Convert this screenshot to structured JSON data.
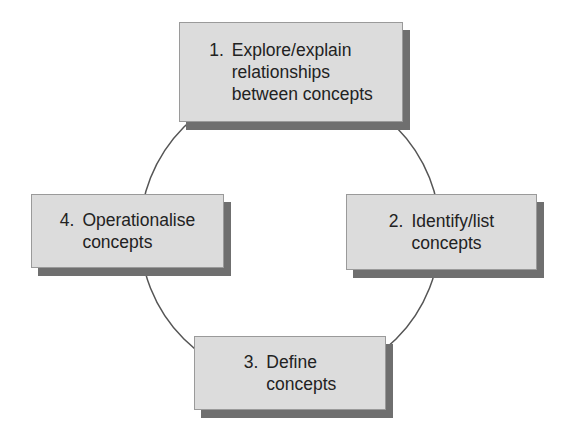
{
  "diagram": {
    "type": "cycle",
    "colors": {
      "box_fill": "#dcdcdc",
      "box_border": "#9a9a9a",
      "box_shadow": "#6f6f6f",
      "text": "#222222",
      "circle_stroke": "#555555",
      "background": "#ffffff"
    },
    "circle": {
      "cx": 290,
      "cy": 233,
      "r": 150
    },
    "steps": [
      {
        "number": "1.",
        "lines": [
          "Explore/explain",
          "relationships",
          "between concepts"
        ]
      },
      {
        "number": "2.",
        "lines": [
          "Identify/list",
          "concepts"
        ]
      },
      {
        "number": "3.",
        "lines": [
          "Define",
          "concepts"
        ]
      },
      {
        "number": "4.",
        "lines": [
          "Operationalise",
          "concepts"
        ]
      }
    ]
  }
}
